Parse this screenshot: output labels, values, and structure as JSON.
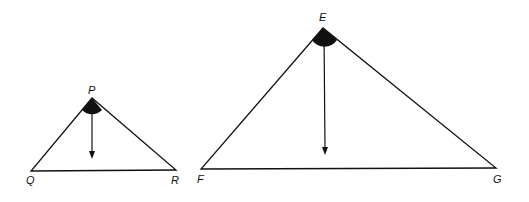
{
  "diagram": {
    "type": "similar-triangles-with-angle-and-altitude-arrow",
    "small_triangle": {
      "vertices": {
        "apex": "P",
        "left": "Q",
        "right": "R"
      },
      "apex_angle_marked": true,
      "arrow_from_apex": true
    },
    "large_triangle": {
      "vertices": {
        "apex": "E",
        "left": "F",
        "right": "G"
      },
      "apex_angle_marked": true,
      "arrow_from_apex": true
    },
    "labels": {
      "P": "P",
      "Q": "Q",
      "R": "R",
      "E": "E",
      "F": "F",
      "G": "G"
    },
    "colors": {
      "stroke": "#111111",
      "background": "#ffffff"
    }
  }
}
